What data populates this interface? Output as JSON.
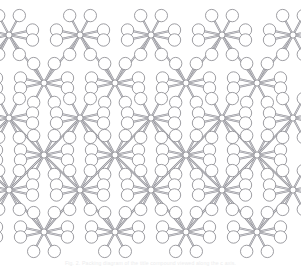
{
  "figure": {
    "domain": "Diagram",
    "kind": "crystal-packing-diagram",
    "caption": "Fig. 2. Packing diagram of the title compound viewed along the c axis.",
    "background_color": "#ffffff",
    "atom_outline_color": "#8c8c92",
    "atom_fill_color": "#ffffff",
    "bond_color": "#8f8f95",
    "bond_edge_color": "#70707a",
    "rod_color": "#a0a0a6",
    "caption_color": "#ececed"
  },
  "geometry": {
    "view_width": 301,
    "view_height": 267,
    "metal_radius": 3.1,
    "ligand_radius": 6.2,
    "small_ligand_radius": 5.0,
    "bond_width": 2.0,
    "rod_length": 26,
    "rod_width": 9,
    "lattice_a": 71,
    "lattice_b": 48,
    "note": "Two-dimensional sheet built from paired metal nodes bridged by elongated rod ligands; each node carries eight peripheral atom spheres."
  },
  "lattice": {
    "columns": 4,
    "rows": 4,
    "row_offsets_y": [
      35,
      83,
      155,
      203
    ],
    "column_offsets_x": [
      44,
      115,
      186,
      257
    ],
    "row_shifts_x": [
      -36,
      0,
      -36,
      0
    ],
    "description": "Alternating rows are offset by half a lattice translation producing the brick-like packing seen in the image."
  },
  "nodes": {
    "count": 16,
    "label": "metal-center",
    "coordination": 8,
    "bridges": 8
  },
  "legend": {
    "items": [
      {
        "name": "metal-center",
        "label": "Metal atom",
        "shape": "small-sphere"
      },
      {
        "name": "ligand-atom",
        "label": "Coordinating atom",
        "shape": "open-sphere"
      },
      {
        "name": "bridging-rod",
        "label": "Bridging ligand",
        "shape": "elongated-rod"
      }
    ]
  }
}
